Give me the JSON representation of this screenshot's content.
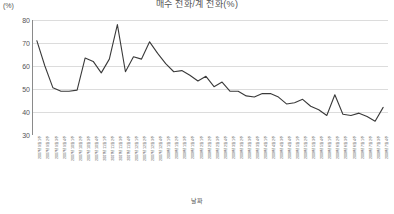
{
  "chart_data": {
    "type": "line",
    "title": "매수 전화/계 전화(%)",
    "xlabel": "날짜",
    "ylabel": "(%)",
    "ylim": [
      30,
      80
    ],
    "yticks": [
      80,
      70,
      60,
      50,
      40,
      30
    ],
    "grid": true,
    "legend": "none",
    "line_color": "#3a3a3a",
    "categories": [
      "2007년 9월 1주",
      "2007년 9월 2주",
      "2007년 9월 3주",
      "2007년 9월 4주",
      "2007년 10월 1주",
      "2007년 10월 2주",
      "2007년 10월 3주",
      "2007년 10월 4주",
      "2007년 11월 1주",
      "2007년 11월 2주",
      "2007년 11월 3주",
      "2007년 11월 4주",
      "2007년 12월 1주",
      "2007년 12월 2주",
      "2007년 12월 3주",
      "2007년 12월 4주",
      "2008년 1월 1주",
      "2008년 1월 2주",
      "2008년 1월 3주",
      "2008년 1월 4주",
      "2008년 2월 1주",
      "2008년 2월 2주",
      "2008년 2월 3주",
      "2008년 2월 4주",
      "2008년 3월 1주",
      "2008년 3월 2주",
      "2008년 3월 3주",
      "2008년 3월 4주",
      "2008년 4월 1주",
      "2008년 4월 2주",
      "2008년 4월 3주",
      "2008년 4월 4주",
      "2008년 5월 1주",
      "2008년 5월 2주",
      "2008년 5월 3주",
      "2008년 5월 4주",
      "2008년 6월 1주",
      "2008년 6월 2주",
      "2008년 6월 3주",
      "2008년 6월 4주",
      "2008년 7월 1주",
      "2008년 7월 2주",
      "2008년 7월 3주",
      "2008년 7월 4주"
    ],
    "values": [
      71.0,
      60.0,
      50.5,
      49.0,
      49.0,
      49.5,
      63.5,
      62.0,
      57.0,
      63.0,
      78.0,
      57.5,
      64.0,
      63.0,
      70.5,
      65.5,
      61.0,
      57.5,
      58.0,
      56.0,
      53.5,
      55.5,
      51.0,
      53.0,
      49.0,
      49.0,
      47.0,
      46.5,
      48.0,
      48.0,
      46.5,
      43.5,
      44.0,
      45.5,
      42.5,
      41.0,
      38.5,
      47.5,
      39.0,
      38.5,
      39.5,
      38.0,
      36.0,
      42.0
    ]
  }
}
